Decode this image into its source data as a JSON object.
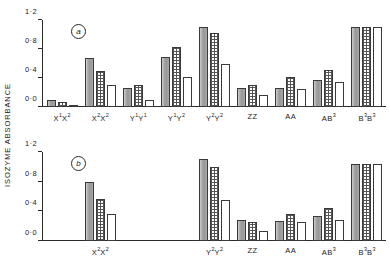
{
  "figure": {
    "ylabel": "ISOZYME  ABSORBANCE",
    "panel_a_tag": "a",
    "panel_b_tag": "b"
  },
  "chart_data": {
    "type": "bar",
    "title": "",
    "xlabel": "",
    "ylabel": "ISOZYME ABSORBANCE",
    "ylim": [
      0.0,
      1.2
    ],
    "yticks": [
      0.0,
      0.4,
      0.8,
      1.2
    ],
    "ytick_labels": [
      "0·0",
      "0·4",
      "0·8",
      "1·2"
    ],
    "grid": false,
    "legend": "none",
    "series_names": [
      "solid-gray",
      "checkered",
      "open-white"
    ],
    "panels": [
      {
        "tag": "a",
        "categories": [
          "X¹X²",
          "X²X²",
          "Y¹Y¹",
          "Y¹Y²",
          "Y²Y²",
          "ZZ",
          "AA",
          "AB³",
          "B³B³"
        ],
        "series": [
          {
            "name": "solid-gray",
            "values": [
              0.1,
              0.67,
              0.26,
              0.69,
              1.1,
              0.26,
              0.26,
              0.37,
              1.1
            ]
          },
          {
            "name": "checkered",
            "values": [
              0.07,
              0.5,
              0.31,
              0.83,
              1.02,
              0.3,
              0.41,
              0.51,
              1.1
            ]
          },
          {
            "name": "open-white",
            "values": [
              0.03,
              0.31,
              0.1,
              0.41,
              0.6,
              0.17,
              0.25,
              0.34,
              1.1
            ]
          }
        ]
      },
      {
        "tag": "b",
        "categories": [
          "",
          "X²X²",
          "",
          "",
          "Y²Y²",
          "ZZ",
          "AA",
          "AB³",
          "B³B³"
        ],
        "series": [
          {
            "name": "solid-gray",
            "values": [
              null,
              0.79,
              null,
              null,
              1.1,
              0.28,
              0.27,
              0.34,
              1.04
            ]
          },
          {
            "name": "checkered",
            "values": [
              null,
              0.57,
              null,
              null,
              1.0,
              0.26,
              0.36,
              0.45,
              1.04
            ]
          },
          {
            "name": "open-white",
            "values": [
              null,
              0.36,
              null,
              null,
              0.55,
              0.13,
              0.25,
              0.29,
              1.04
            ]
          }
        ]
      }
    ]
  }
}
